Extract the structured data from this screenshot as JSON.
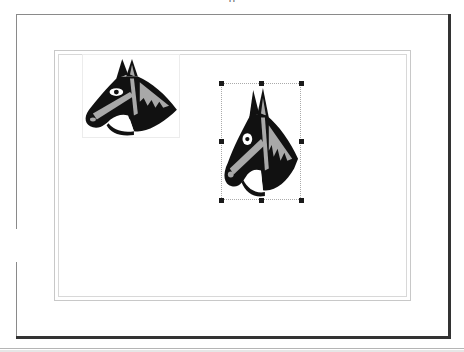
{
  "document": {
    "top_clipped_text": "g",
    "page": {
      "background": "#ffffff",
      "shadow_color": "#2b2b2b",
      "margin_guide_color": "#c8c8c8"
    },
    "objects": [
      {
        "type": "clip-art",
        "subject": "horse-head",
        "selected": false,
        "colors": {
          "fill": "#111111",
          "accent": "#a8a8a8",
          "highlight": "#ffffff"
        }
      },
      {
        "type": "clip-art",
        "subject": "horse-head",
        "selected": true,
        "colors": {
          "fill": "#111111",
          "accent": "#a8a8a8",
          "highlight": "#ffffff"
        },
        "selection_handles": [
          "top-left",
          "top-center",
          "top-right",
          "middle-left",
          "middle-right",
          "bottom-left",
          "bottom-center",
          "bottom-right"
        ]
      }
    ]
  }
}
